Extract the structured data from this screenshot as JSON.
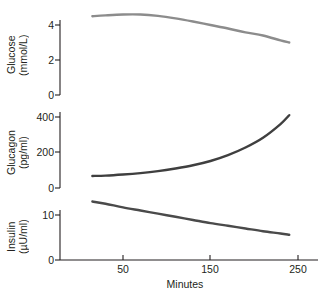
{
  "chart_data": {
    "type": "line",
    "title": "",
    "xlabel": "Minutes",
    "xlim": [
      0,
      270
    ],
    "xticks": [
      50,
      150,
      250
    ],
    "xtick_labels": [
      "50",
      "150",
      "250"
    ],
    "grid": false,
    "legend": "none",
    "panels": [
      {
        "name": "glucose",
        "ylabel_line1": "Glucose",
        "ylabel_line2": "(mmol/L)",
        "ylabel": "Glucose (mmol/L)",
        "ylim": [
          0,
          5.2
        ],
        "yticks": [
          0,
          2,
          4
        ],
        "ytick_labels": [
          "0",
          "2",
          "4"
        ],
        "line_color": "#8c8c8c",
        "x": [
          15,
          30,
          50,
          70,
          90,
          110,
          130,
          150,
          170,
          190,
          210,
          230,
          240
        ],
        "y": [
          4.5,
          4.55,
          4.6,
          4.6,
          4.52,
          4.38,
          4.2,
          4.0,
          3.8,
          3.58,
          3.4,
          3.12,
          3.0
        ]
      },
      {
        "name": "glucagon",
        "ylabel_line1": "Glucagon",
        "ylabel_line2": "(pg/ml)",
        "ylabel": "Glucagon (pg/ml)",
        "ylim": [
          0,
          430
        ],
        "yticks": [
          0,
          200,
          400
        ],
        "ytick_labels": [
          "0",
          "200",
          "400"
        ],
        "line_color": "#3f3f3f",
        "x": [
          15,
          30,
          50,
          70,
          90,
          110,
          130,
          150,
          170,
          190,
          210,
          230,
          240
        ],
        "y": [
          68,
          70,
          76,
          84,
          95,
          110,
          128,
          152,
          185,
          228,
          283,
          360,
          410
        ]
      },
      {
        "name": "insulin",
        "ylabel_line1": "Insulin",
        "ylabel_line2": "(µU/ml)",
        "ylabel": "Insulin (µU/ml)",
        "ylim": [
          0,
          14.5
        ],
        "yticks": [
          0,
          10
        ],
        "ytick_labels": [
          "0",
          "10"
        ],
        "line_color": "#4a4a4a",
        "x": [
          15,
          30,
          50,
          70,
          90,
          110,
          130,
          150,
          170,
          190,
          210,
          230,
          240
        ],
        "y": [
          13.0,
          12.5,
          11.7,
          11.0,
          10.3,
          9.6,
          8.9,
          8.2,
          7.6,
          7.0,
          6.4,
          5.9,
          5.6
        ]
      }
    ]
  },
  "axes": {
    "x_axis_title": "Minutes",
    "x_tick_50": "50",
    "x_tick_150": "150",
    "x_tick_250": "250"
  },
  "panel_glucose": {
    "label_line1": "Glucose",
    "label_line2": "(mmol/L)",
    "tick_0": "0",
    "tick_2": "2",
    "tick_4": "4"
  },
  "panel_glucagon": {
    "label_line1": "Glucagon",
    "label_line2": "(pg/ml)",
    "tick_0": "0",
    "tick_200": "200",
    "tick_400": "400"
  },
  "panel_insulin": {
    "label_line1": "Insulin",
    "label_line2": "(µU/ml)",
    "tick_0": "0",
    "tick_10": "10"
  },
  "colors": {
    "background": "#ffffff",
    "axis": "#231f20",
    "glucose_line": "#8c8c8c",
    "glucagon_line": "#3f3f3f",
    "insulin_line": "#4a4a4a"
  }
}
